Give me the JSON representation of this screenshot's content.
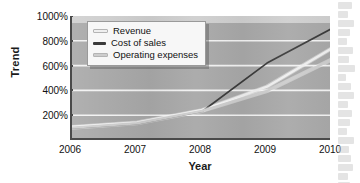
{
  "chart_data": {
    "type": "line",
    "title": "",
    "xlabel": "Year",
    "ylabel": "Trend",
    "x": [
      2006,
      2007,
      2008,
      2009,
      2010
    ],
    "xtick_labels": [
      "2006",
      "2007",
      "2008",
      "2009",
      "2010"
    ],
    "xlim": [
      2006,
      2010
    ],
    "ylim": [
      0,
      1000
    ],
    "ytick_values": [
      200,
      400,
      600,
      800,
      1000
    ],
    "ytick_labels": [
      "200%",
      "400%",
      "600%",
      "800%",
      "1000%"
    ],
    "y_unit": "%",
    "grid": "horizontal",
    "legend_position": "top-left inside plot",
    "series": [
      {
        "name": "Revenue",
        "color": "#efefef",
        "values": [
          105,
          140,
          240,
          430,
          740
        ]
      },
      {
        "name": "Cost of sales",
        "color": "#3a3a3a",
        "values": [
          95,
          130,
          230,
          620,
          900
        ]
      },
      {
        "name": "Operating expenses",
        "color": "#cdcdcd",
        "values": [
          100,
          135,
          235,
          395,
          650
        ]
      }
    ]
  },
  "axes": {
    "y_title": "Trend",
    "x_title": "Year"
  },
  "legend": {
    "items": [
      {
        "label": "Revenue",
        "color": "#efefef"
      },
      {
        "label": "Cost of sales",
        "color": "#3a3a3a"
      },
      {
        "label": "Operating expenses",
        "color": "#cdcdcd"
      }
    ]
  },
  "colors": {
    "plot_background": "#a8a8a8",
    "axis_line": "#4a4a4a",
    "gridline": "#f2f2f2",
    "page_background": "#ffffff",
    "text": "#111111"
  }
}
